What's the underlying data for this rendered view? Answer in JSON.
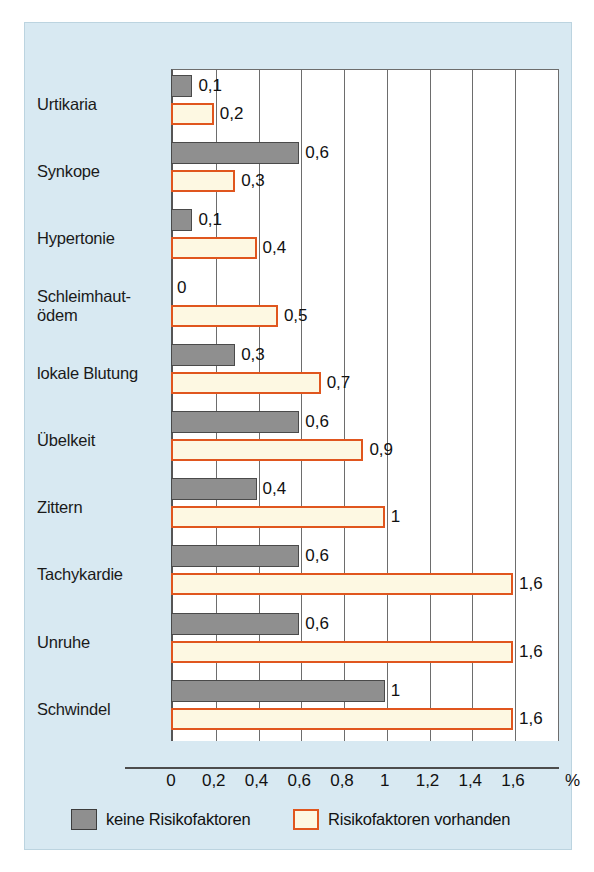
{
  "chart_data": {
    "type": "bar",
    "orientation": "horizontal",
    "title": "",
    "xlabel": "%",
    "ylabel": "",
    "xlim": [
      0,
      1.6
    ],
    "xticks": [
      0,
      0.2,
      0.4,
      0.6,
      0.8,
      1,
      1.2,
      1.4,
      1.6
    ],
    "xtick_labels": [
      "0",
      "0,2",
      "0,4",
      "0,6",
      "0,8",
      "1",
      "1,2",
      "1,4",
      "1,6"
    ],
    "grid": true,
    "legend_position": "bottom",
    "categories": [
      "Urtikaria",
      "Synkope",
      "Hypertonie",
      "Schleimhaut-ödem",
      "lokale Blutung",
      "Übelkeit",
      "Zittern",
      "Tachykardie",
      "Unruhe",
      "Schwindel"
    ],
    "category_lines": [
      [
        "Urtikaria"
      ],
      [
        "Synkope"
      ],
      [
        "Hypertonie"
      ],
      [
        "Schleimhaut-",
        "ödem"
      ],
      [
        "lokale Blutung"
      ],
      [
        "Übelkeit"
      ],
      [
        "Zittern"
      ],
      [
        "Tachykardie"
      ],
      [
        "Unruhe"
      ],
      [
        "Schwindel"
      ]
    ],
    "series": [
      {
        "name": "keine Risikofaktoren",
        "color": "#8f8f8f",
        "border_color": "#4a4a4a",
        "values": [
          0.1,
          0.6,
          0.1,
          0,
          0.3,
          0.6,
          0.4,
          0.6,
          0.6,
          1
        ],
        "labels": [
          "0,1",
          "0,6",
          "0,1",
          "0",
          "0,3",
          "0,6",
          "0,4",
          "0,6",
          "0,6",
          "1"
        ]
      },
      {
        "name": "Risikofaktoren vorhanden",
        "color": "#fdf8e2",
        "border_color": "#e0561e",
        "values": [
          0.2,
          0.3,
          0.4,
          0.5,
          0.7,
          0.9,
          1,
          1.6,
          1.6,
          1.6
        ],
        "labels": [
          "0,2",
          "0,3",
          "0,4",
          "0,5",
          "0,7",
          "0,9",
          "1",
          "1,6",
          "1,6",
          "1,6"
        ]
      }
    ]
  },
  "legend": {
    "items": [
      {
        "label": "keine Risikofaktoren",
        "swatch": "gray"
      },
      {
        "label": "Risikofaktoren vorhanden",
        "swatch": "cream"
      }
    ]
  },
  "colors": {
    "panel_background": "#d8e9f2",
    "plot_background": "#ffffff",
    "gray_bar": "#8f8f8f",
    "cream_bar": "#fdf8e2",
    "orange_border": "#e0561e",
    "axis": "#4d4d4d"
  }
}
